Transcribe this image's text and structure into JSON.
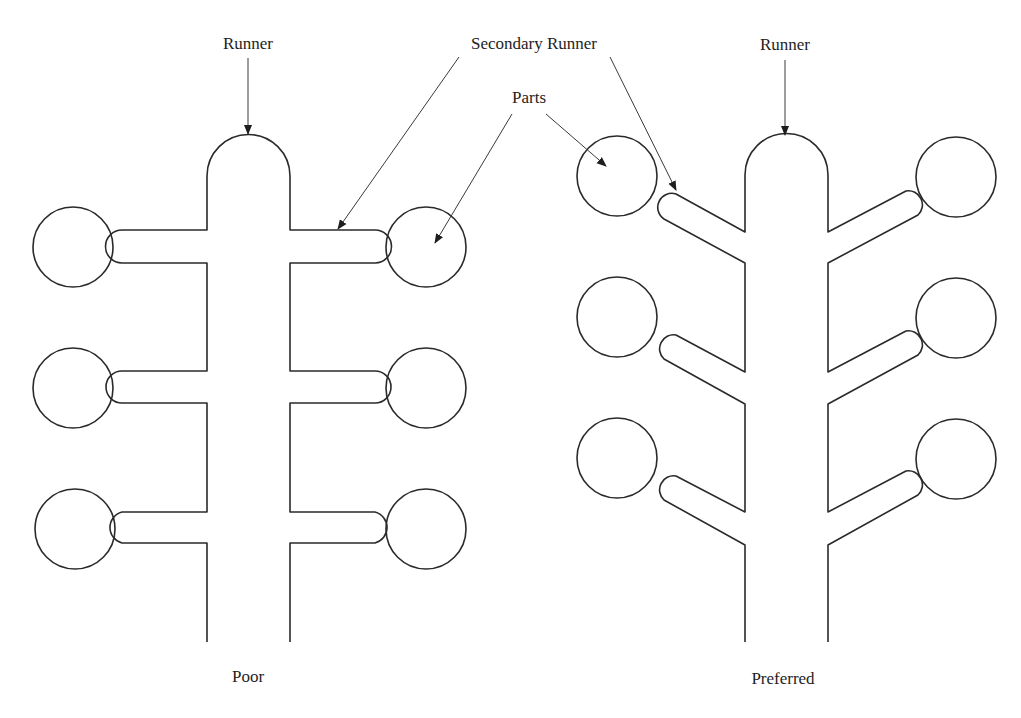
{
  "diagram": {
    "colors": {
      "stroke": "#2a2a2a",
      "background": "#ffffff"
    },
    "labels": {
      "runner_left": "Runner",
      "secondary_runner": "Secondary Runner",
      "parts": "Parts",
      "runner_right": "Runner",
      "poor": "Poor",
      "preferred": "Preferred"
    },
    "layouts": [
      {
        "name": "Poor",
        "branch_style": "perpendicular",
        "parts_count": 6
      },
      {
        "name": "Preferred",
        "branch_style": "angled",
        "parts_count": 6
      }
    ]
  }
}
